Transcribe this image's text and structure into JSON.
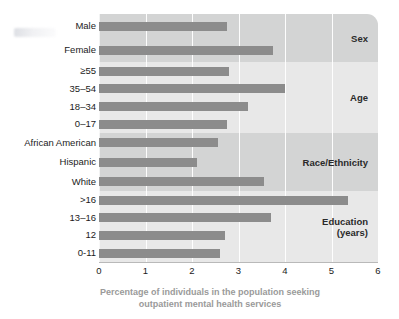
{
  "chart_data": {
    "type": "bar",
    "orientation": "horizontal",
    "title": "",
    "xlabel": "Percentage of individuals in the population seeking outpatient mental health services",
    "ylabel": "",
    "xlim": [
      0,
      6
    ],
    "xticks": [
      "0",
      "1",
      "2",
      "3",
      "4",
      "5",
      "6"
    ],
    "grid": "vertical",
    "legend": "none",
    "bar_color": "#8c8c8c",
    "band_color_dark": "#d3d4d4",
    "band_color_light": "#e8e8e8",
    "categories": [
      "Male",
      "Female",
      "≥55",
      "35–54",
      "18–34",
      "0–17",
      "African American",
      "Hispanic",
      "White",
      ">16",
      "13–16",
      "12",
      "0-11"
    ],
    "values": [
      2.75,
      3.75,
      2.8,
      4.0,
      3.2,
      2.75,
      2.55,
      2.1,
      3.55,
      5.35,
      3.7,
      2.7,
      2.6
    ],
    "groups": [
      {
        "label": "Sex",
        "shade": "dark",
        "items": [
          {
            "category": "Male",
            "value": 2.75
          },
          {
            "category": "Female",
            "value": 3.75
          }
        ]
      },
      {
        "label": "Age",
        "shade": "light",
        "items": [
          {
            "category": "≥55",
            "value": 2.8
          },
          {
            "category": "35–54",
            "value": 4.0
          },
          {
            "category": "18–34",
            "value": 3.2
          },
          {
            "category": "0–17",
            "value": 2.75
          }
        ]
      },
      {
        "label": "Race/Ethnicity",
        "shade": "dark",
        "items": [
          {
            "category": "African American",
            "value": 2.55
          },
          {
            "category": "Hispanic",
            "value": 2.1
          },
          {
            "category": "White",
            "value": 3.55
          }
        ]
      },
      {
        "label": "Education\n(years)",
        "shade": "light",
        "items": [
          {
            "category": ">16",
            "value": 5.35
          },
          {
            "category": "13–16",
            "value": 3.7
          },
          {
            "category": "12",
            "value": 2.7
          },
          {
            "category": "0-11",
            "value": 2.6
          }
        ]
      }
    ]
  },
  "axis": {
    "title_line1": "Percentage of individuals in the population seeking",
    "title_line2": "outpatient mental health services"
  }
}
